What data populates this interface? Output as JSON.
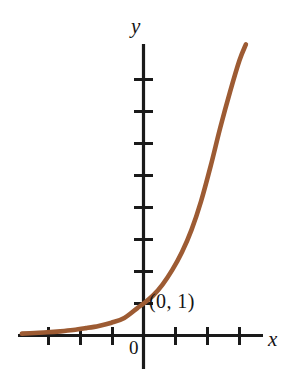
{
  "figure": {
    "background_color": "#ffffff",
    "curve_color": "#9d5b33",
    "axis_color": "#1a1a1a",
    "axis_labels": {
      "x": "x",
      "y": "y"
    },
    "origin_label": "0",
    "annotations": [
      {
        "name": "y-intercept",
        "text": "(0, 1)",
        "x": 0,
        "y": 1
      }
    ]
  },
  "chart_data": {
    "type": "line",
    "title": "",
    "subtitle": "",
    "xlabel": "x",
    "ylabel": "y",
    "grid": false,
    "legend": null,
    "series": [
      {
        "name": "exponential growth",
        "color": "#9d5b33",
        "x": [
          -3.8,
          -3.4,
          -3.0,
          -2.6,
          -2.2,
          -1.8,
          -1.4,
          -1.0,
          -0.6,
          -0.2,
          0.0,
          0.3,
          0.6,
          0.9,
          1.2,
          1.5,
          1.8,
          2.1,
          2.4,
          2.7,
          3.0,
          3.2
        ],
        "y": [
          0.06,
          0.08,
          0.1,
          0.13,
          0.17,
          0.23,
          0.3,
          0.4,
          0.55,
          0.85,
          1.0,
          1.25,
          1.6,
          2.05,
          2.6,
          3.3,
          4.2,
          5.3,
          6.5,
          7.6,
          8.6,
          9.1
        ]
      }
    ],
    "annotations": [
      {
        "text": "(0, 1)",
        "x": 0,
        "y": 1
      }
    ],
    "xlim": [
      -4.4,
      3.9
    ],
    "ylim": [
      -0.9,
      9.6
    ],
    "x_ticks": [
      -3,
      -2,
      -1,
      1,
      2,
      3
    ],
    "y_ticks": [
      1,
      2,
      3,
      4,
      5,
      6,
      7,
      8
    ],
    "x_tick_labels": [],
    "y_tick_labels": []
  }
}
